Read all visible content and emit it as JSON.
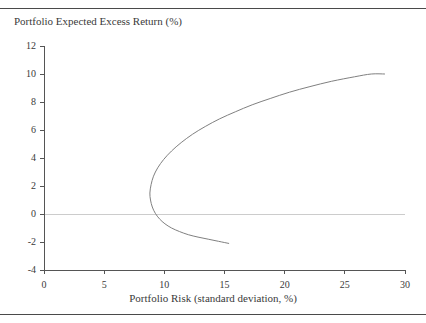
{
  "figure": {
    "background_color": "#ffffff",
    "rule_color": "#4a4a4a",
    "top_rule_name": "top-rule",
    "bottom_rule_name": "bottom-rule"
  },
  "chart_data": {
    "type": "line",
    "title": "Portfolio Expected Excess Return (%)",
    "subtitle": "",
    "xlabel": "Portfolio Risk (standard deviation, %)",
    "ylabel": "Portfolio Expected Excess Return (%)",
    "xlim": [
      0,
      30
    ],
    "ylim": [
      -4,
      12
    ],
    "xticks": [
      0,
      5,
      10,
      15,
      20,
      25,
      30
    ],
    "yticks": [
      -4,
      -2,
      0,
      2,
      4,
      6,
      8,
      10,
      12
    ],
    "xtick_labels": [
      "0",
      "5",
      "10",
      "15",
      "20",
      "25",
      "30"
    ],
    "ytick_labels": [
      "-4",
      "-2",
      "0",
      "2",
      "4",
      "6",
      "8",
      "10",
      "12"
    ],
    "grid": false,
    "zero_line": true,
    "zero_line_value": 0,
    "zero_line_color": "#cccccc",
    "legend": false,
    "legend_position": "none",
    "line_color": "#808080",
    "line_width": 1,
    "annotations": [],
    "series": [
      {
        "name": "Minimum-variance frontier",
        "comment": "x = portfolio risk (standard deviation, %), y = expected excess return (%)",
        "points": [
          [
            28.3,
            9.95
          ],
          [
            27.2,
            9.5
          ],
          [
            26.1,
            9.05
          ],
          [
            25.0,
            8.58
          ],
          [
            23.9,
            8.1
          ],
          [
            22.8,
            7.6
          ],
          [
            21.7,
            7.08
          ],
          [
            20.6,
            6.55
          ],
          [
            19.5,
            6.0
          ],
          [
            18.4,
            5.42
          ],
          [
            17.3,
            4.82
          ],
          [
            16.2,
            4.18
          ],
          [
            15.1,
            3.52
          ],
          [
            14.0,
            2.8
          ],
          [
            13.0,
            2.08
          ],
          [
            12.0,
            1.28
          ],
          [
            11.2,
            0.52
          ],
          [
            10.5,
            -0.22
          ],
          [
            9.9,
            -1.0
          ],
          [
            9.5,
            -1.7
          ],
          [
            9.2,
            -2.5
          ],
          [
            9.0,
            -3.2
          ],
          [
            8.95,
            -3.6
          ]
        ],
        "upper_branch": [
          [
            8.8,
            1.5
          ],
          [
            8.9,
            2.1
          ],
          [
            9.1,
            2.7
          ],
          [
            9.45,
            3.3
          ],
          [
            9.95,
            3.9
          ],
          [
            10.6,
            4.5
          ],
          [
            11.4,
            5.1
          ],
          [
            12.35,
            5.7
          ],
          [
            13.4,
            6.25
          ],
          [
            14.6,
            6.8
          ],
          [
            15.9,
            7.3
          ],
          [
            17.3,
            7.8
          ],
          [
            18.8,
            8.25
          ],
          [
            20.4,
            8.7
          ],
          [
            22.1,
            9.1
          ],
          [
            23.9,
            9.48
          ],
          [
            25.8,
            9.8
          ],
          [
            27.2,
            10.0
          ],
          [
            28.3,
            10.0
          ]
        ],
        "lower_branch": [
          [
            8.8,
            1.5
          ],
          [
            8.85,
            1.0
          ],
          [
            9.0,
            0.5
          ],
          [
            9.25,
            0.05
          ],
          [
            9.6,
            -0.35
          ],
          [
            10.05,
            -0.7
          ],
          [
            10.6,
            -1.0
          ],
          [
            11.25,
            -1.25
          ],
          [
            12.0,
            -1.48
          ],
          [
            12.8,
            -1.65
          ],
          [
            13.65,
            -1.8
          ],
          [
            14.5,
            -1.95
          ],
          [
            15.35,
            -2.1
          ]
        ],
        "vertex": [
          8.8,
          1.5
        ]
      }
    ]
  }
}
